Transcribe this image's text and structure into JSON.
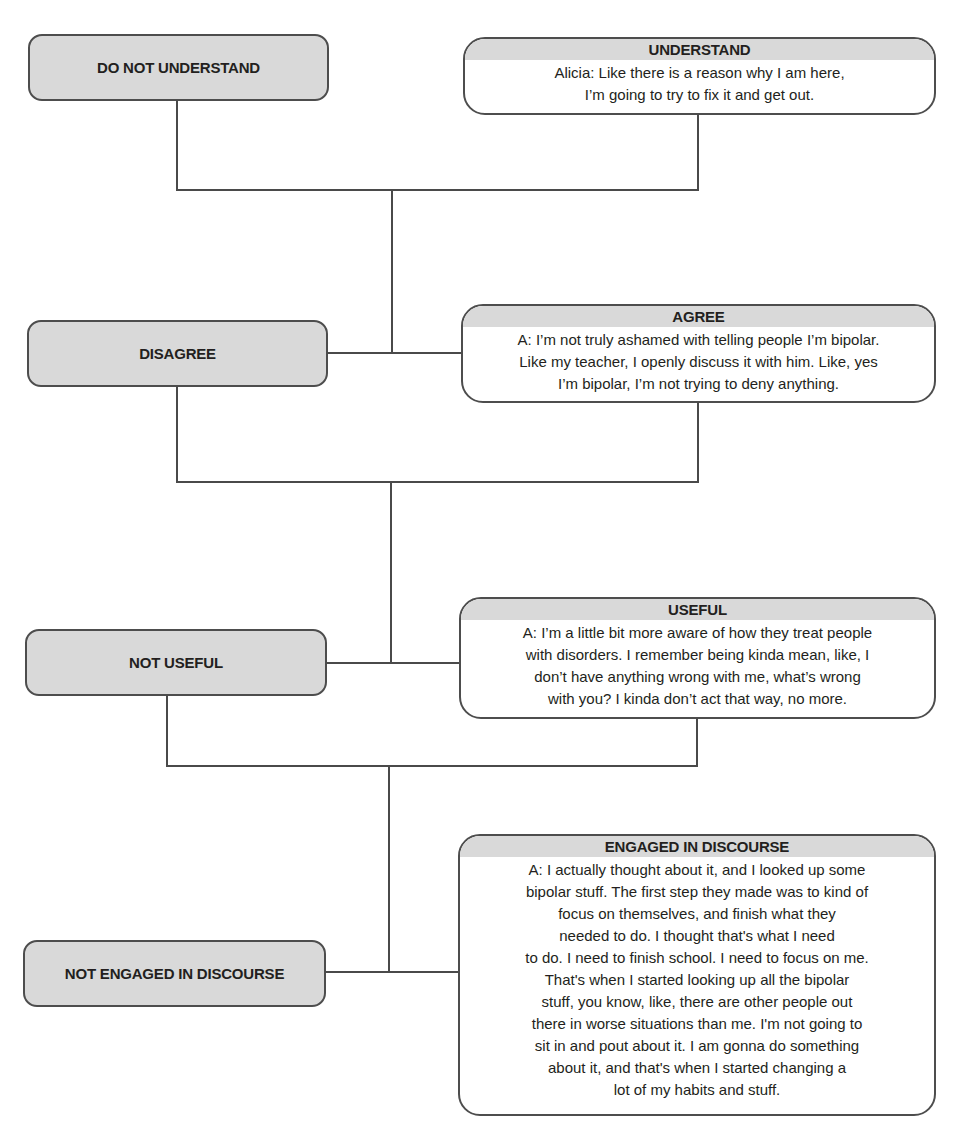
{
  "diagram": {
    "rows": [
      {
        "negative": {
          "label": "DO NOT UNDERSTAND"
        },
        "positive": {
          "header": "UNDERSTAND",
          "lines": [
            "Alicia: Like there is a reason why I am here,",
            "I’m going to try to fix it and get out."
          ]
        }
      },
      {
        "negative": {
          "label": "DISAGREE"
        },
        "positive": {
          "header": "AGREE",
          "lines": [
            "A: I’m not truly ashamed with telling people I’m bipolar.",
            "Like my teacher, I openly discuss it with him. Like, yes",
            "I’m bipolar, I’m not trying to deny anything."
          ]
        }
      },
      {
        "negative": {
          "label": "NOT USEFUL"
        },
        "positive": {
          "header": "USEFUL",
          "lines": [
            "A: I’m a little bit more aware of how they treat people",
            "with disorders. I remember being kinda mean, like, I",
            "don’t have anything wrong with me, what’s wrong",
            "with you? I kinda don’t act that way, no more."
          ]
        }
      },
      {
        "negative": {
          "label": "NOT ENGAGED IN DISCOURSE"
        },
        "positive": {
          "header": "ENGAGED IN DISCOURSE",
          "lines": [
            "A: I actually thought about it, and I looked up some",
            "bipolar stuff. The first step they made was to kind of",
            "focus on themselves, and finish what they",
            "needed to do. I thought that's what I need",
            "to do. I need to finish school. I need to focus on me.",
            "That's when I started looking up all the bipolar",
            "stuff, you know, like, there are other people out",
            "there in worse situations than me. I'm not going to",
            "sit in and pout about it. I am gonna do something",
            "about it, and that's when I started changing a",
            "lot of my habits and stuff."
          ]
        }
      }
    ],
    "colors": {
      "box_fill": "#d9d9d9",
      "box_border": "#4d4d4d",
      "line": "#4a4a4a",
      "text": "#231f20"
    }
  }
}
